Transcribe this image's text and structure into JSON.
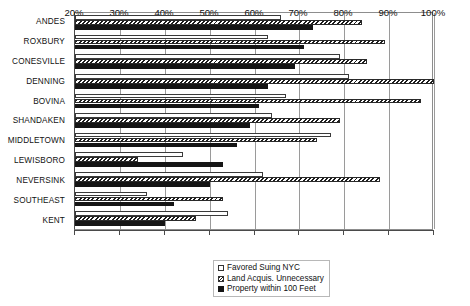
{
  "chart_data": {
    "type": "bar",
    "orientation": "horizontal",
    "title": "",
    "subtitle": "",
    "xlabel": "",
    "ylabel": "",
    "xlim": [
      20,
      100
    ],
    "xticks": [
      20,
      30,
      40,
      50,
      60,
      70,
      80,
      90,
      100
    ],
    "xticklabels": [
      "20%",
      "30%",
      "40%",
      "50%",
      "60%",
      "70%",
      "80%",
      "90%",
      "100%"
    ],
    "grid": "vertical",
    "legend_position": "bottom-center",
    "categories": [
      "ANDES",
      "ROXBURY",
      "CONESVILLE",
      "DENNING",
      "BOVINA",
      "SHANDAKEN",
      "MIDDLETOWN",
      "LEWISBORO",
      "NEVERSINK",
      "SOUTHEAST",
      "KENT"
    ],
    "series": [
      {
        "name": "Favored Suing NYC",
        "style": "open",
        "color": "#ffffff",
        "values": [
          66,
          63,
          79,
          81,
          67,
          64,
          77,
          44,
          62,
          36,
          54
        ]
      },
      {
        "name": "Land Acquis. Unnecessary",
        "style": "hatched",
        "color": "#1d1d1d",
        "values": [
          84,
          89,
          85,
          100,
          97,
          79,
          74,
          34,
          88,
          53,
          47
        ]
      },
      {
        "name": "Property within 100 Feet",
        "style": "solid",
        "color": "#151515",
        "values": [
          73,
          71,
          69,
          63,
          61,
          59,
          56,
          53,
          50,
          42,
          40
        ]
      }
    ]
  },
  "legend": {
    "items": [
      {
        "label": "Favored Suing NYC",
        "swatch": "open-square-icon"
      },
      {
        "label": "Land Acquis. Unnecessary",
        "swatch": "hatched-square-icon"
      },
      {
        "label": "Property within 100 Feet",
        "swatch": "filled-square-icon"
      }
    ]
  }
}
